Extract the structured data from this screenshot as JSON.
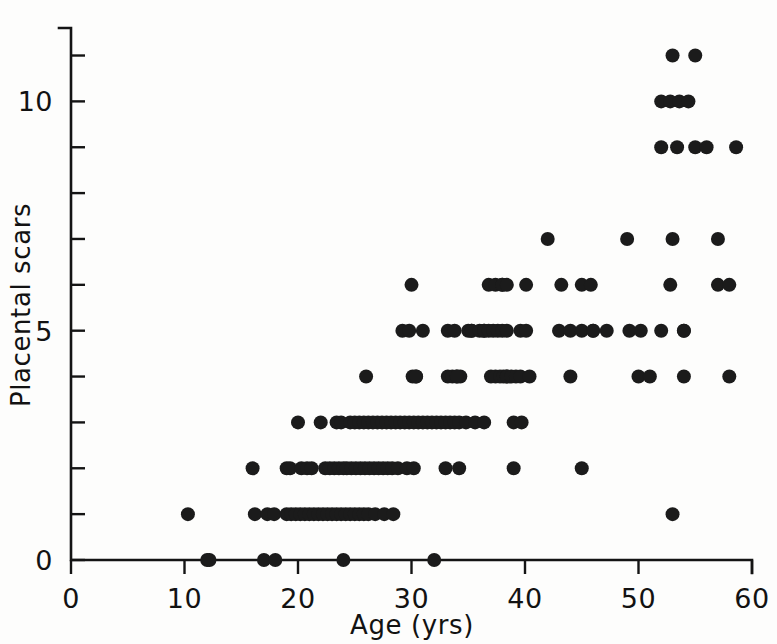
{
  "chart_data": {
    "type": "scatter",
    "title": "",
    "xlabel": "Age (yrs)",
    "ylabel": "Placental scars",
    "xlim": [
      0,
      60
    ],
    "ylim": [
      0,
      11.6
    ],
    "grid": false,
    "legend": null,
    "x_ticks_labeled": [
      0,
      10,
      20,
      30,
      40,
      50,
      60
    ],
    "x_tick_labels": [
      "0",
      "10",
      "20",
      "30",
      "40",
      "50",
      "60"
    ],
    "x_ticks_minor": [
      0,
      10,
      20,
      30,
      40,
      50,
      60
    ],
    "y_ticks_labeled": [
      0,
      5,
      10
    ],
    "y_tick_labels": [
      "0",
      "5",
      "10"
    ],
    "y_ticks_minor": [
      0,
      1,
      2,
      3,
      4,
      5,
      6,
      7,
      8,
      9,
      10,
      11
    ],
    "marker": "filled-circle",
    "marker_color": "#1b1b1b",
    "marker_radius_px": 7,
    "n_points": 214,
    "points": [
      [
        12.0,
        0
      ],
      [
        12.2,
        0
      ],
      [
        17.0,
        0
      ],
      [
        18.0,
        0
      ],
      [
        24.0,
        0
      ],
      [
        32.0,
        0
      ],
      [
        10.3,
        1
      ],
      [
        16.2,
        1
      ],
      [
        17.3,
        1
      ],
      [
        17.9,
        1
      ],
      [
        19.0,
        1
      ],
      [
        19.4,
        1
      ],
      [
        19.8,
        1
      ],
      [
        20.2,
        1
      ],
      [
        20.6,
        1
      ],
      [
        21.0,
        1
      ],
      [
        21.4,
        1
      ],
      [
        21.8,
        1
      ],
      [
        22.2,
        1
      ],
      [
        22.6,
        1
      ],
      [
        23.0,
        1
      ],
      [
        23.4,
        1
      ],
      [
        23.8,
        1
      ],
      [
        24.2,
        1
      ],
      [
        24.6,
        1
      ],
      [
        25.0,
        1
      ],
      [
        25.4,
        1
      ],
      [
        25.8,
        1
      ],
      [
        26.2,
        1
      ],
      [
        26.8,
        1
      ],
      [
        27.6,
        1
      ],
      [
        28.4,
        1
      ],
      [
        53.0,
        1
      ],
      [
        16.0,
        2
      ],
      [
        19.0,
        2
      ],
      [
        19.3,
        2
      ],
      [
        20.3,
        2
      ],
      [
        20.8,
        2
      ],
      [
        21.2,
        2
      ],
      [
        22.4,
        2
      ],
      [
        22.8,
        2
      ],
      [
        23.2,
        2
      ],
      [
        23.6,
        2
      ],
      [
        24.0,
        2
      ],
      [
        24.3,
        2
      ],
      [
        24.7,
        2
      ],
      [
        25.1,
        2
      ],
      [
        25.5,
        2
      ],
      [
        25.9,
        2
      ],
      [
        26.3,
        2
      ],
      [
        26.7,
        2
      ],
      [
        27.1,
        2
      ],
      [
        27.5,
        2
      ],
      [
        27.9,
        2
      ],
      [
        28.3,
        2
      ],
      [
        28.8,
        2
      ],
      [
        29.6,
        2
      ],
      [
        30.2,
        2
      ],
      [
        33.0,
        2
      ],
      [
        34.2,
        2
      ],
      [
        39.0,
        2
      ],
      [
        45.0,
        2
      ],
      [
        20.0,
        3
      ],
      [
        22.0,
        3
      ],
      [
        23.4,
        3
      ],
      [
        23.8,
        3
      ],
      [
        24.6,
        3
      ],
      [
        25.0,
        3
      ],
      [
        25.4,
        3
      ],
      [
        25.8,
        3
      ],
      [
        26.2,
        3
      ],
      [
        26.6,
        3
      ],
      [
        27.0,
        3
      ],
      [
        27.4,
        3
      ],
      [
        27.8,
        3
      ],
      [
        28.2,
        3
      ],
      [
        28.6,
        3
      ],
      [
        29.0,
        3
      ],
      [
        29.4,
        3
      ],
      [
        29.8,
        3
      ],
      [
        30.2,
        3
      ],
      [
        30.6,
        3
      ],
      [
        31.0,
        3
      ],
      [
        31.4,
        3
      ],
      [
        31.8,
        3
      ],
      [
        32.2,
        3
      ],
      [
        32.6,
        3
      ],
      [
        33.0,
        3
      ],
      [
        33.4,
        3
      ],
      [
        33.8,
        3
      ],
      [
        34.2,
        3
      ],
      [
        34.8,
        3
      ],
      [
        35.6,
        3
      ],
      [
        36.4,
        3
      ],
      [
        39.0,
        3
      ],
      [
        39.7,
        3
      ],
      [
        26.0,
        4
      ],
      [
        30.1,
        4
      ],
      [
        30.4,
        4
      ],
      [
        30.4,
        4
      ],
      [
        33.2,
        4
      ],
      [
        33.6,
        4
      ],
      [
        34.0,
        4
      ],
      [
        34.3,
        4
      ],
      [
        34.0,
        4
      ],
      [
        37.0,
        4
      ],
      [
        37.4,
        4
      ],
      [
        37.8,
        4
      ],
      [
        38.1,
        4
      ],
      [
        38.4,
        4
      ],
      [
        38.4,
        4
      ],
      [
        38.8,
        4
      ],
      [
        39.2,
        4
      ],
      [
        39.6,
        4
      ],
      [
        40.4,
        4
      ],
      [
        44.0,
        4
      ],
      [
        50.0,
        4
      ],
      [
        51.0,
        4
      ],
      [
        54.0,
        4
      ],
      [
        58.0,
        4
      ],
      [
        29.2,
        5
      ],
      [
        29.8,
        5
      ],
      [
        31.0,
        5
      ],
      [
        33.2,
        5
      ],
      [
        33.8,
        5
      ],
      [
        35.0,
        5
      ],
      [
        35.3,
        5
      ],
      [
        35.3,
        5
      ],
      [
        36.0,
        5
      ],
      [
        36.4,
        5
      ],
      [
        36.4,
        5
      ],
      [
        36.8,
        5
      ],
      [
        37.2,
        5
      ],
      [
        37.6,
        5
      ],
      [
        38.0,
        5
      ],
      [
        38.4,
        5
      ],
      [
        39.6,
        5
      ],
      [
        40.1,
        5
      ],
      [
        43.0,
        5
      ],
      [
        44.0,
        5
      ],
      [
        45.0,
        5
      ],
      [
        46.0,
        5
      ],
      [
        46.0,
        5
      ],
      [
        47.2,
        5
      ],
      [
        49.2,
        5
      ],
      [
        50.2,
        5
      ],
      [
        52.0,
        5
      ],
      [
        54.0,
        5
      ],
      [
        54.0,
        5
      ],
      [
        30.0,
        6
      ],
      [
        36.8,
        6
      ],
      [
        37.4,
        6
      ],
      [
        38.0,
        6
      ],
      [
        38.0,
        6
      ],
      [
        38.4,
        6
      ],
      [
        40.1,
        6
      ],
      [
        43.2,
        6
      ],
      [
        45.0,
        6
      ],
      [
        45.8,
        6
      ],
      [
        52.8,
        6
      ],
      [
        57.0,
        6
      ],
      [
        58.0,
        6
      ],
      [
        42.0,
        7
      ],
      [
        49.0,
        7
      ],
      [
        53.0,
        7
      ],
      [
        57.0,
        7
      ],
      [
        52.0,
        9
      ],
      [
        53.4,
        9
      ],
      [
        55.0,
        9
      ],
      [
        56.0,
        9
      ],
      [
        58.6,
        9
      ],
      [
        52.0,
        10
      ],
      [
        52.8,
        10
      ],
      [
        53.6,
        10
      ],
      [
        54.4,
        10
      ],
      [
        53.0,
        11
      ],
      [
        55.0,
        11
      ]
    ]
  },
  "axes": {
    "x_axis_name": "Age (yrs)",
    "y_axis_name": "Placental scars"
  }
}
